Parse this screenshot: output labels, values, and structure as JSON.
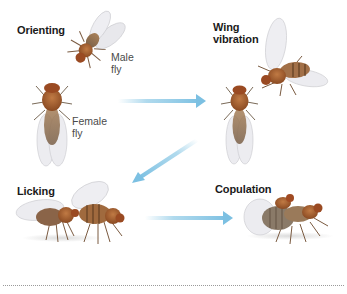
{
  "stages": [
    {
      "label": "Orienting"
    },
    {
      "label_line1": "Wing",
      "label_line2": "vibration"
    },
    {
      "label": "Licking"
    },
    {
      "label": "Copulation"
    }
  ],
  "fly_labels": {
    "male_line1": "Male",
    "male_line2": "fly",
    "female_line1": "Female",
    "female_line2": "fly"
  },
  "arrows": [
    {
      "from": "Orienting",
      "to": "Wing vibration",
      "direction": "right"
    },
    {
      "from": "Wing vibration",
      "to": "Licking",
      "direction": "down-left"
    },
    {
      "from": "Licking",
      "to": "Copulation",
      "direction": "right"
    }
  ],
  "colors": {
    "arrow": "#8ecae6",
    "fly_body": "#a0582a",
    "fly_abdomen": "#b08a60",
    "wing": "#e8e8ec",
    "text": "#1a1a1a",
    "label_text": "#4a4a4a"
  }
}
